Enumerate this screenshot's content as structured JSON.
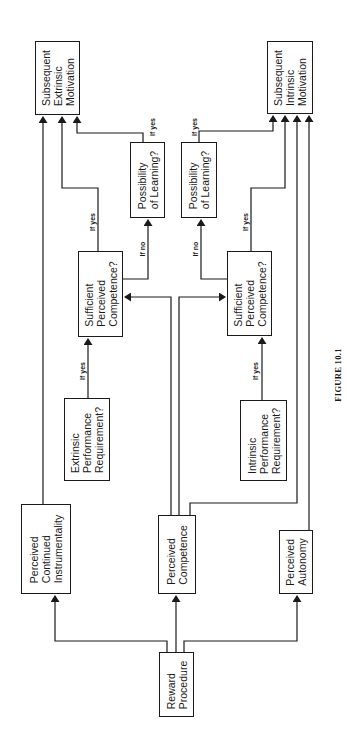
{
  "figure": {
    "caption": "FIGURE 10.1",
    "orientation": "rotated 90° counter-clockwise (text reads bottom-to-top)"
  },
  "nodes": {
    "reward_procedure": {
      "lines": [
        "Reward",
        "Procedure"
      ]
    },
    "perceived_instrumentality": {
      "lines": [
        "Perceived",
        "Continued",
        "Instrumentality"
      ]
    },
    "perceived_competence": {
      "lines": [
        "Perceived",
        "Competence"
      ]
    },
    "perceived_autonomy": {
      "lines": [
        "Perceived",
        "Autonomy"
      ]
    },
    "extrinsic_requirement": {
      "lines": [
        "Extrinsic",
        "Performance",
        "Requirement?"
      ]
    },
    "intrinsic_requirement": {
      "lines": [
        "Intrinsic",
        "Performance",
        "Requirement?"
      ]
    },
    "sufficient_competence_extrinsic": {
      "lines": [
        "Sufficient",
        "Perceived",
        "Competence?"
      ]
    },
    "sufficient_competence_intrinsic": {
      "lines": [
        "Sufficient",
        "Perceived",
        "Competence?"
      ]
    },
    "possibility_learning_extrinsic": {
      "lines": [
        "Possibility",
        "of Learning?"
      ]
    },
    "possibility_learning_intrinsic": {
      "lines": [
        "Possibility",
        "of Learning?"
      ]
    },
    "subsequent_extrinsic": {
      "lines": [
        "Subsequent",
        "Extrinsic",
        "Motivation"
      ]
    },
    "subsequent_intrinsic": {
      "lines": [
        "Subsequent",
        "Intrinsic",
        "Motivation"
      ]
    }
  },
  "edge_labels": {
    "if_yes": "If yes",
    "if_no": "If no"
  },
  "edges": [
    {
      "from": "reward_procedure",
      "to": "perceived_instrumentality"
    },
    {
      "from": "reward_procedure",
      "to": "perceived_competence"
    },
    {
      "from": "reward_procedure",
      "to": "perceived_autonomy"
    },
    {
      "from": "perceived_instrumentality",
      "to": "subsequent_extrinsic"
    },
    {
      "from": "perceived_competence",
      "to": "sufficient_competence_extrinsic"
    },
    {
      "from": "perceived_competence",
      "to": "sufficient_competence_intrinsic"
    },
    {
      "from": "perceived_competence",
      "to": "subsequent_intrinsic"
    },
    {
      "from": "perceived_autonomy",
      "to": "subsequent_intrinsic"
    },
    {
      "from": "extrinsic_requirement",
      "to": "sufficient_competence_extrinsic",
      "label": "If yes"
    },
    {
      "from": "intrinsic_requirement",
      "to": "sufficient_competence_intrinsic",
      "label": "If yes"
    },
    {
      "from": "sufficient_competence_extrinsic",
      "to": "subsequent_extrinsic",
      "label": "If yes"
    },
    {
      "from": "sufficient_competence_extrinsic",
      "to": "possibility_learning_extrinsic",
      "label": "If no"
    },
    {
      "from": "sufficient_competence_intrinsic",
      "to": "subsequent_intrinsic",
      "label": "If yes"
    },
    {
      "from": "sufficient_competence_intrinsic",
      "to": "possibility_learning_intrinsic",
      "label": "If no"
    },
    {
      "from": "possibility_learning_extrinsic",
      "to": "subsequent_extrinsic",
      "label": "If yes"
    },
    {
      "from": "possibility_learning_intrinsic",
      "to": "subsequent_intrinsic",
      "label": "If yes"
    }
  ],
  "colors": {
    "ink": "#1a1a1a",
    "background": "#ffffff"
  }
}
